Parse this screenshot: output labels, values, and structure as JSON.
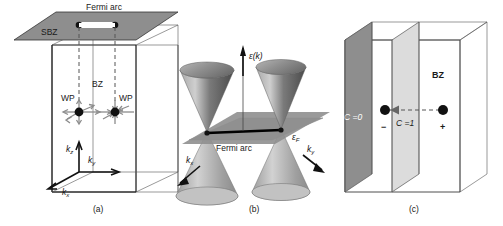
{
  "figure": {
    "background_color": "#ffffff",
    "panels": [
      {
        "id": "a",
        "caption": "(a)",
        "labels": {
          "surface_bz": "SBZ",
          "fermi_arc": "Fermi arc",
          "bulk_bz": "BZ",
          "weyl_point_left": "WP",
          "weyl_point_right": "WP",
          "axis_kz": "k",
          "axis_kz_sub": "z",
          "axis_ky": "k",
          "axis_ky_sub": "y",
          "axis_kx": "k",
          "axis_kx_sub": "x"
        },
        "colors": {
          "surface_plane": "#8e8e8e",
          "box_edge": "#222222",
          "weyl_dot": "#111111",
          "chirality_arrow": "#8c8c8c"
        }
      },
      {
        "id": "b",
        "caption": "(b)",
        "labels": {
          "energy_axis": "ε(k)",
          "fermi_energy": "ε",
          "fermi_energy_sub": "F",
          "fermi_arc": "Fermi arc",
          "axis_kx": "k",
          "axis_kx_sub": "x",
          "axis_ky": "k",
          "axis_ky_sub": "y"
        },
        "colors": {
          "cone_light": "#b9b9b9",
          "cone_dark": "#4a4a4a",
          "fermi_plane": "#909090",
          "arc_line": "#000000"
        }
      },
      {
        "id": "c",
        "caption": "(c)",
        "labels": {
          "chern_zero": "C =0",
          "chern_one": "C =1",
          "bulk_bz": "BZ",
          "charge_negative": "−",
          "charge_positive": "+"
        },
        "colors": {
          "plane_c0": "#8e8e8e",
          "plane_c1": "#dcdcdc",
          "box_edge": "#222222",
          "weyl_dot": "#111111"
        }
      }
    ]
  }
}
